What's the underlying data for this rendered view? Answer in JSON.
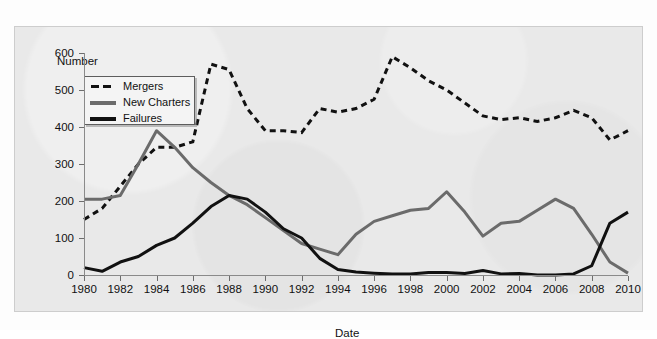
{
  "figure": {
    "top_cut_text": "",
    "panel_background": "#e9e9e9",
    "page_background": "#fdfdfd"
  },
  "legend": {
    "position": "top-left-inside",
    "items": [
      {
        "label": "Mergers",
        "color": "#111111",
        "style": "dashed",
        "key": "dashed-key-mergers"
      },
      {
        "label": "New Charters",
        "color": "#6b6b6b",
        "style": "solid",
        "key": "solid-key-new-charters"
      },
      {
        "label": "Failures",
        "color": "#111111",
        "style": "solid",
        "key": "solid-key-failures"
      }
    ]
  },
  "chart_data": {
    "type": "line",
    "title": "",
    "xlabel": "Date",
    "ylabel": "Number",
    "xlim": [
      1980,
      2010
    ],
    "ylim": [
      0,
      600
    ],
    "yticks": [
      0,
      100,
      200,
      300,
      400,
      500,
      600
    ],
    "xticks": [
      1980,
      1982,
      1984,
      1986,
      1988,
      1990,
      1992,
      1994,
      1996,
      1998,
      2000,
      2002,
      2004,
      2006,
      2008,
      2010
    ],
    "grid": false,
    "legend_position": "upper left",
    "x": [
      1980,
      1981,
      1982,
      1983,
      1984,
      1985,
      1986,
      1987,
      1988,
      1989,
      1990,
      1991,
      1992,
      1993,
      1994,
      1995,
      1996,
      1997,
      1998,
      1999,
      2000,
      2001,
      2002,
      2003,
      2004,
      2005,
      2006,
      2007,
      2008,
      2009,
      2010
    ],
    "series": [
      {
        "name": "Mergers",
        "color": "#111111",
        "style": "dashed",
        "values": [
          150,
          180,
          240,
          300,
          345,
          345,
          360,
          570,
          555,
          450,
          390,
          390,
          385,
          450,
          440,
          450,
          475,
          590,
          560,
          525,
          500,
          465,
          430,
          420,
          425,
          415,
          425,
          445,
          425,
          365,
          390
        ]
      },
      {
        "name": "New Charters",
        "color": "#6b6b6b",
        "style": "solid",
        "values": [
          205,
          205,
          215,
          300,
          390,
          345,
          290,
          250,
          215,
          190,
          155,
          120,
          85,
          70,
          55,
          110,
          145,
          160,
          175,
          180,
          225,
          170,
          105,
          140,
          145,
          175,
          205,
          180,
          110,
          35,
          5
        ]
      },
      {
        "name": "Failures",
        "color": "#111111",
        "style": "solid",
        "values": [
          20,
          10,
          35,
          50,
          80,
          100,
          140,
          185,
          215,
          205,
          170,
          125,
          100,
          45,
          15,
          8,
          5,
          3,
          3,
          7,
          7,
          4,
          12,
          3,
          4,
          0,
          0,
          3,
          25,
          140,
          170
        ]
      }
    ]
  }
}
